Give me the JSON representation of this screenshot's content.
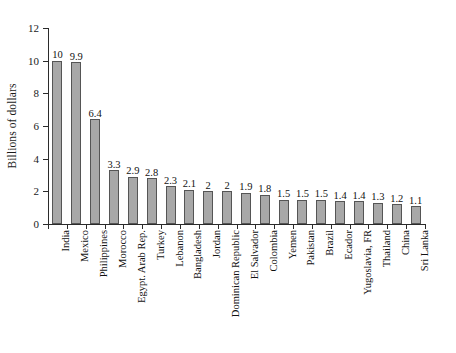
{
  "chart_data": {
    "type": "bar",
    "title": "",
    "subtitle": "",
    "xlabel": "",
    "ylabel": "Billions of dollars",
    "ylim": [
      0,
      12
    ],
    "yticks": [
      0,
      2,
      4,
      6,
      8,
      10,
      12
    ],
    "ytick_labels": [
      "0",
      "2",
      "4",
      "6",
      "8",
      "10",
      "12"
    ],
    "grid": false,
    "legend": null,
    "bar_color": "#a8a8a8",
    "bar_edge_color": "#555555",
    "axis_color": "#2b2b2b",
    "categories": [
      "India",
      "Mexico",
      "Philippines",
      "Morocco",
      "Egypt. Arab Rep.",
      "Turkey",
      "Lebanon",
      "Bangladesh",
      "Jordan",
      "Dominican Republic",
      "El Salvador",
      "Colombia",
      "Yemen",
      "Pakistan",
      "Brazil",
      "Ecador",
      "Yugoslavia, FR",
      "Thailand",
      "China",
      "Sri Lanka"
    ],
    "values": [
      10,
      9.9,
      6.4,
      3.3,
      2.9,
      2.8,
      2.3,
      2.1,
      2,
      2,
      1.9,
      1.8,
      1.5,
      1.5,
      1.5,
      1.4,
      1.4,
      1.3,
      1.2,
      1.1
    ],
    "value_labels": [
      "10",
      "9.9",
      "6.4",
      "3.3",
      "2.9",
      "2.8",
      "2.3",
      "2.1",
      "2",
      "2",
      "1.9",
      "1.8",
      "1.5",
      "1.5",
      "1.5",
      "1.4",
      "1.4",
      "1.3",
      "1.2",
      "1.1"
    ]
  }
}
